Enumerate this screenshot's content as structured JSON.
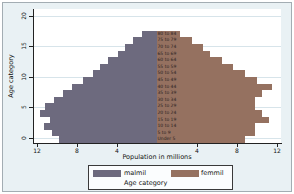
{
  "window": {
    "background_color": "#e9f1f4",
    "frame_border_color": "#a3adb3",
    "plot_background_color": "#ffffff",
    "gridline_color": "#d7e4ea"
  },
  "chart_data": {
    "type": "bar",
    "variant": "population-pyramid",
    "title": "",
    "xlabel": "Population in millions",
    "ylabel": "Age category",
    "grid": true,
    "categories_bottom_to_top": [
      "Under 5",
      "5 to 9",
      "10 to 14",
      "15 to 19",
      "20 to 24",
      "25 to 29",
      "30 to 34",
      "35 to 39",
      "40 to 44",
      "45 to 49",
      "50 to 54",
      "55 to 59",
      "60 to 64",
      "65 to 69",
      "70 to 74",
      "75 to 79",
      "80 to 84"
    ],
    "series": [
      {
        "name": "malmil",
        "side": "left",
        "color": "#6d6a7e",
        "values": [
          9.8,
          10.5,
          11.3,
          10.7,
          11.7,
          11.2,
          10.3,
          9.4,
          8.5,
          7.4,
          6.4,
          5.7,
          4.9,
          3.9,
          3.2,
          2.4,
          1.5
        ]
      },
      {
        "name": "femmil",
        "side": "right",
        "color": "#957160",
        "values": [
          8.8,
          9.8,
          9.8,
          11.2,
          10.5,
          9.8,
          9.8,
          10.5,
          11.5,
          10.0,
          8.8,
          7.6,
          6.5,
          5.3,
          4.6,
          3.5,
          2.3
        ]
      }
    ],
    "x_axis": {
      "tick_values_left": [
        12,
        8,
        4
      ],
      "tick_values_right": [
        4,
        8,
        12
      ],
      "max_per_side": 12.4
    },
    "y_axis": {
      "tick_values": [
        0,
        5,
        10,
        15,
        20
      ],
      "range": [
        0,
        20
      ]
    },
    "legend": {
      "position": "bottom",
      "entries": [
        {
          "label": "malmil"
        },
        {
          "label": "femmil"
        }
      ],
      "note": "Age category"
    }
  }
}
